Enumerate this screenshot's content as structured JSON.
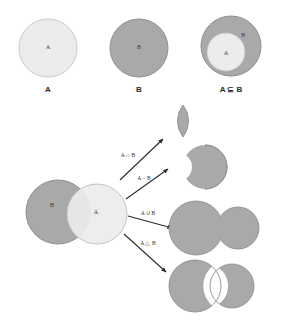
{
  "figure": {
    "background": "#ffffff",
    "colors": {
      "set_a_fill": "#ececec",
      "set_b_fill": "#a9a9a9",
      "result_fill": "#a9a9a9",
      "outline": "#8f8f8f",
      "arrow": "#2b2b2b",
      "text": "#333333"
    }
  },
  "top_row": {
    "panels": [
      {
        "caption": "A",
        "inner_labels": [
          "A"
        ]
      },
      {
        "caption": "B",
        "inner_labels": [
          "B"
        ]
      },
      {
        "caption": "A ⊆ B",
        "inner_labels": [
          "A",
          "B"
        ]
      }
    ]
  },
  "source": {
    "left_circle_label": "B",
    "right_circle_label": "A"
  },
  "operations": [
    {
      "label": "A ∩ B",
      "name": "intersection",
      "result_shape": "lens"
    },
    {
      "label": "A − B",
      "name": "difference",
      "result_shape": "crescent"
    },
    {
      "label": "A ∪ B",
      "name": "union",
      "result_shape": "merged-circles"
    },
    {
      "label": "A △ B",
      "name": "symmetric-difference",
      "result_shape": "circles-with-lens-hole"
    }
  ]
}
